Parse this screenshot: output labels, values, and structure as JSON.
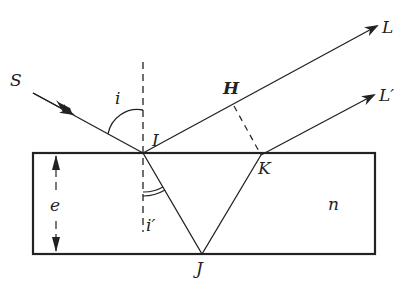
{
  "figure": {
    "type": "thin-film interference diagram",
    "colors": {
      "ink": "#222222",
      "background": "#ffffff"
    }
  },
  "labels": {
    "S": "S",
    "I": "I",
    "i": "i",
    "i_prime": "i′",
    "H": "H",
    "L": "L",
    "L_prime": "L′",
    "K": "K",
    "J": "J",
    "e": "e",
    "n": "n"
  },
  "geometry": {
    "slab": {
      "left": 33,
      "top": 153,
      "right": 375,
      "bottom": 254
    },
    "I": [
      143,
      153
    ],
    "K": [
      261,
      155
    ],
    "J": [
      202,
      254
    ],
    "H": [
      234,
      106
    ]
  }
}
